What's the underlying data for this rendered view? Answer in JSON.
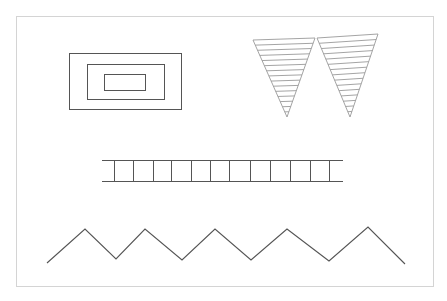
{
  "figure": {
    "frame": {
      "x": 16,
      "y": 16,
      "w": 417,
      "h": 270,
      "stroke": "#d4d4d4"
    },
    "line_color": "#555555",
    "hatch_color": "#9a9a9a",
    "nested_rectangles": [
      {
        "x": 69,
        "y": 53,
        "w": 112,
        "h": 56
      },
      {
        "x": 87,
        "y": 64,
        "w": 77,
        "h": 35
      },
      {
        "x": 104,
        "y": 74,
        "w": 41,
        "h": 16
      }
    ],
    "hatched_triangles": [
      {
        "top_left": [
          253,
          40
        ],
        "top_right": [
          315,
          38
        ],
        "apex": [
          287,
          117
        ],
        "hatch_lines": 15
      },
      {
        "top_left": [
          317,
          38
        ],
        "top_right": [
          378,
          34
        ],
        "apex": [
          350,
          117
        ],
        "hatch_lines": 15
      }
    ],
    "ladder": {
      "x1": 102,
      "x2": 343,
      "y_top": 160,
      "y_bottom": 181,
      "rungs_x": [
        114,
        133,
        153,
        171,
        191,
        210,
        229,
        250,
        270,
        290,
        310,
        329
      ]
    },
    "zigzag": {
      "points": [
        [
          47,
          263
        ],
        [
          85,
          229
        ],
        [
          116,
          259
        ],
        [
          145,
          229
        ],
        [
          182,
          260
        ],
        [
          215,
          229
        ],
        [
          251,
          260
        ],
        [
          287,
          229
        ],
        [
          329,
          261
        ],
        [
          368,
          227
        ],
        [
          405,
          264
        ]
      ]
    }
  }
}
